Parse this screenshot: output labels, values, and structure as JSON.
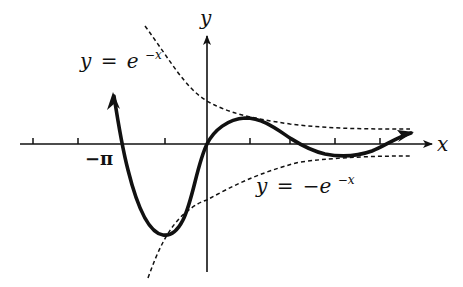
{
  "diagram": {
    "type": "function-graph",
    "axes": {
      "x_label": "x",
      "y_label": "y",
      "tick_label_left": "−π",
      "ticks_x": [
        33,
        78,
        165,
        250,
        290,
        335,
        380
      ]
    },
    "curves": [
      {
        "name": "upper-envelope",
        "label_lhs": "y",
        "label_eq": "=",
        "label_rhs": "e",
        "label_exp": "−x",
        "style": "dashed"
      },
      {
        "name": "lower-envelope",
        "label_lhs": "y",
        "label_eq": "=",
        "label_rhs": "−e",
        "label_exp": "−x",
        "style": "dashed"
      },
      {
        "name": "damped-oscillation",
        "style": "solid-thick"
      }
    ],
    "colors": {
      "ink": "#111111",
      "background": "#ffffff"
    }
  }
}
